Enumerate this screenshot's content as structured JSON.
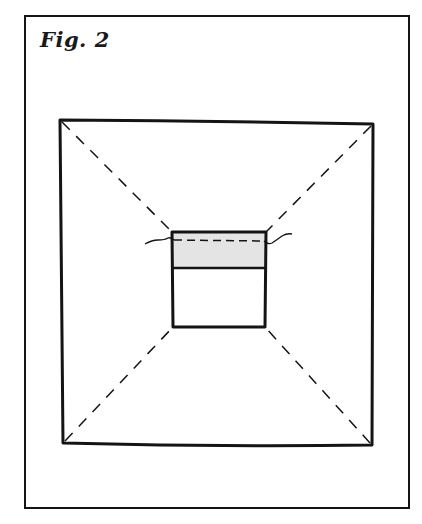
{
  "figure": {
    "title": "Fig. 2"
  },
  "colors": {
    "ink": "#141414",
    "shaded_band": "#e4e4e4",
    "background": "#ffffff"
  },
  "diagram": {
    "outer_frame": {
      "x1": 25,
      "y1": 16,
      "x2": 409,
      "y2": 508
    },
    "outer_square": {
      "corners": {
        "top_left": [
          60,
          120
        ],
        "top_right": [
          373,
          124
        ],
        "bottom_right": [
          372,
          445
        ],
        "bottom_left": [
          63,
          443
        ]
      }
    },
    "inner_box": {
      "corners": {
        "top_left": [
          172,
          232
        ],
        "top_right": [
          266,
          232
        ],
        "bottom_right": [
          265,
          327
        ],
        "bottom_left": [
          173,
          327
        ]
      },
      "divider_y": 268,
      "shaded_region": "top"
    },
    "dashed_diagonals": 4,
    "string_line": {
      "left_start": [
        145,
        241
      ],
      "right_end": [
        292,
        234
      ],
      "dashed_across_box_y": 240
    }
  }
}
